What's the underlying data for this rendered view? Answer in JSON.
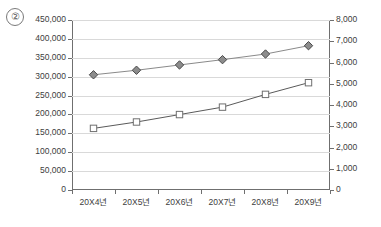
{
  "index_marker": "②",
  "chart_data": {
    "type": "line",
    "title": "",
    "xlabel": "",
    "ylabel": "",
    "grid": true,
    "legend": "none",
    "categories": [
      "20X4년",
      "20X5년",
      "20X6년",
      "20X7년",
      "20X8년",
      "20X9년"
    ],
    "axes": {
      "left": {
        "min": 0,
        "max": 450000,
        "step": 50000,
        "ticks": [
          "0",
          "50,000",
          "100,000",
          "150,000",
          "200,000",
          "250,000",
          "300,000",
          "350,000",
          "400,000",
          "450,000"
        ],
        "tick_values": [
          0,
          50000,
          100000,
          150000,
          200000,
          250000,
          300000,
          350000,
          400000,
          450000
        ]
      },
      "right": {
        "min": 0,
        "max": 8000,
        "step": 1000,
        "ticks": [
          "0",
          "1,000",
          "2,000",
          "3,000",
          "4,000",
          "5,000",
          "6,000",
          "7,000",
          "8,000"
        ],
        "tick_values": [
          0,
          1000,
          2000,
          3000,
          4000,
          5000,
          6000,
          7000,
          8000
        ]
      }
    },
    "series": [
      {
        "name": "series-diamond",
        "axis": "left",
        "marker": "diamond",
        "marker_fill": "#8c8c8c",
        "marker_stroke": "#4a4a4a",
        "line_color": "#8a8a8a",
        "values": [
          305000,
          317000,
          331000,
          345000,
          360000,
          382000
        ]
      },
      {
        "name": "series-square",
        "axis": "right",
        "marker": "square",
        "marker_fill": "#ffffff",
        "marker_stroke": "#6f6f6f",
        "line_color": "#5a5a5a",
        "values": [
          2900,
          3200,
          3550,
          3900,
          4500,
          5050
        ]
      }
    ]
  }
}
